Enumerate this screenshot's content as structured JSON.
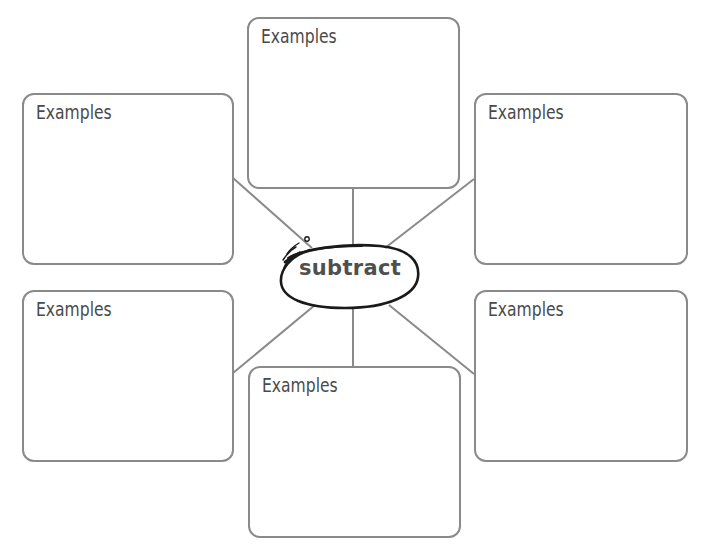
{
  "diagram": {
    "type": "word web / concept map",
    "center": {
      "label": "subtract"
    },
    "boxes": [
      {
        "position": "top",
        "label": "Examples"
      },
      {
        "position": "top-left",
        "label": "Examples"
      },
      {
        "position": "top-right",
        "label": "Examples"
      },
      {
        "position": "bottom-left",
        "label": "Examples"
      },
      {
        "position": "bottom-right",
        "label": "Examples"
      },
      {
        "position": "bottom",
        "label": "Examples"
      }
    ],
    "colors": {
      "box_border": "#8a8a8a",
      "connector": "#8a8a8a",
      "label_text": "#4a4a4a",
      "oval_stroke": "#1a1a1a",
      "center_text": "#4f4f4f"
    }
  }
}
